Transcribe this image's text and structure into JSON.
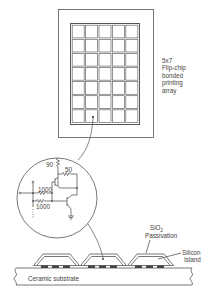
{
  "figure": {
    "array_label_lines": [
      "5x7",
      "Flip-chip",
      "bonded",
      "printing",
      "array"
    ],
    "array": {
      "columns": 5,
      "rows": 7,
      "highlighted_cell": {
        "row": 6,
        "col": 1
      }
    },
    "circuit": {
      "resistor_top": "90",
      "resistor_collector": "50",
      "resistor_input_1": "1000",
      "resistor_input_2": "1000"
    },
    "passivation_label": "SiO",
    "passivation_subscript": "2",
    "passivation_word": "Passivation",
    "silicon_island_lines": [
      "Silicon",
      "Island"
    ],
    "substrate_label": "Ceramic substrate"
  },
  "colors": {
    "line": "#555555",
    "pad": "#444444",
    "background": "#ffffff"
  }
}
